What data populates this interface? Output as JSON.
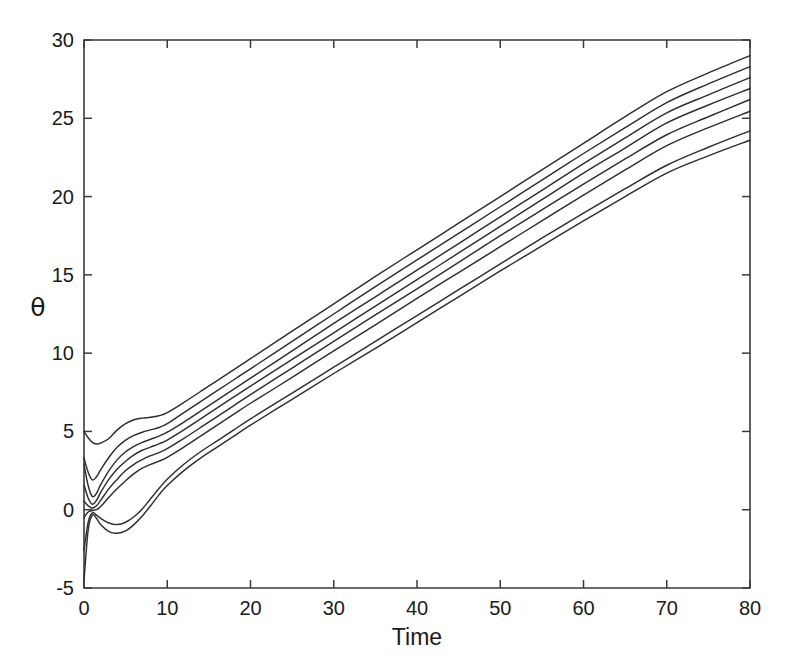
{
  "chart_data": {
    "type": "line",
    "title": "",
    "xlabel": "Time",
    "ylabel": "θ",
    "xlim": [
      0,
      80
    ],
    "ylim": [
      -5,
      30
    ],
    "xticks": [
      0,
      10,
      20,
      30,
      40,
      50,
      60,
      70,
      80
    ],
    "yticks": [
      -5,
      0,
      5,
      10,
      15,
      20,
      25,
      30
    ],
    "xtick_labels": [
      "0",
      "10",
      "20",
      "30",
      "40",
      "50",
      "60",
      "70",
      "80"
    ],
    "ytick_labels": [
      "-5",
      "0",
      "5",
      "10",
      "15",
      "20",
      "25",
      "30"
    ],
    "grid": false,
    "legend": false,
    "legend_position": "none",
    "series_count": 8,
    "line_color": "#2e2e2e",
    "background_color": "#ffffff",
    "axis_color": "#3b3b3b",
    "x": [
      0,
      0.5,
      1,
      1.5,
      2,
      3,
      4,
      5,
      6,
      7,
      8,
      9,
      10,
      12,
      14,
      16,
      18,
      20,
      25,
      30,
      35,
      40,
      45,
      50,
      55,
      60,
      65,
      70,
      75,
      80
    ],
    "series": [
      {
        "name": "curve-1",
        "values": [
          5.0,
          4.6,
          4.3,
          4.2,
          4.25,
          4.55,
          5.1,
          5.5,
          5.75,
          5.85,
          5.9,
          6.0,
          6.2,
          6.85,
          7.55,
          8.25,
          8.95,
          9.65,
          11.4,
          13.15,
          14.9,
          16.6,
          18.3,
          20.0,
          21.7,
          23.4,
          25.1,
          26.7,
          27.9,
          29.0
        ]
      },
      {
        "name": "curve-2",
        "values": [
          3.3,
          2.4,
          1.9,
          2.1,
          2.55,
          3.35,
          4.0,
          4.45,
          4.75,
          4.95,
          5.1,
          5.25,
          5.5,
          6.2,
          6.9,
          7.6,
          8.3,
          9.0,
          10.75,
          12.5,
          14.25,
          15.95,
          17.65,
          19.35,
          21.05,
          22.75,
          24.4,
          26.0,
          27.2,
          28.3
        ]
      },
      {
        "name": "curve-3",
        "values": [
          2.9,
          1.55,
          0.85,
          1.05,
          1.6,
          2.5,
          3.2,
          3.7,
          4.05,
          4.3,
          4.5,
          4.7,
          4.95,
          5.6,
          6.3,
          7.0,
          7.7,
          8.4,
          10.15,
          11.9,
          13.6,
          15.3,
          17.0,
          18.7,
          20.4,
          22.1,
          23.75,
          25.35,
          26.5,
          27.6
        ]
      },
      {
        "name": "curve-4",
        "values": [
          1.6,
          0.75,
          0.35,
          0.6,
          1.1,
          1.95,
          2.6,
          3.1,
          3.5,
          3.8,
          4.0,
          4.2,
          4.45,
          5.1,
          5.8,
          6.5,
          7.2,
          7.9,
          9.6,
          11.3,
          13.0,
          14.7,
          16.4,
          18.1,
          19.8,
          21.5,
          23.1,
          24.7,
          25.85,
          26.9
        ]
      },
      {
        "name": "curve-5",
        "values": [
          0.55,
          0.25,
          0.1,
          0.25,
          0.6,
          1.35,
          1.95,
          2.5,
          2.9,
          3.2,
          3.45,
          3.65,
          3.9,
          4.55,
          5.25,
          5.95,
          6.65,
          7.35,
          9.05,
          10.75,
          12.45,
          14.1,
          15.8,
          17.5,
          19.15,
          20.8,
          22.4,
          23.95,
          25.1,
          26.2
        ]
      },
      {
        "name": "curve-6",
        "values": [
          -0.5,
          -0.15,
          -0.05,
          0.0,
          0.2,
          0.8,
          1.35,
          1.85,
          2.3,
          2.65,
          2.9,
          3.1,
          3.35,
          4.0,
          4.7,
          5.4,
          6.1,
          6.8,
          8.45,
          10.15,
          11.8,
          13.5,
          15.15,
          16.8,
          18.45,
          20.1,
          21.7,
          23.25,
          24.4,
          25.45
        ]
      },
      {
        "name": "curve-7",
        "values": [
          -2.6,
          -0.8,
          -0.2,
          -0.35,
          -0.55,
          -0.85,
          -0.95,
          -0.8,
          -0.45,
          0.05,
          0.7,
          1.35,
          1.95,
          2.9,
          3.7,
          4.4,
          5.1,
          5.8,
          7.45,
          9.1,
          10.75,
          12.4,
          14.05,
          15.7,
          17.35,
          18.95,
          20.5,
          22.0,
          23.15,
          24.2
        ]
      },
      {
        "name": "curve-8",
        "values": [
          -4.5,
          -1.3,
          -0.35,
          -0.55,
          -0.95,
          -1.4,
          -1.5,
          -1.35,
          -0.95,
          -0.4,
          0.25,
          0.95,
          1.55,
          2.5,
          3.3,
          4.0,
          4.7,
          5.4,
          7.05,
          8.7,
          10.3,
          11.95,
          13.6,
          15.25,
          16.85,
          18.45,
          20.0,
          21.5,
          22.6,
          23.6
        ]
      }
    ]
  },
  "figure": {
    "caption": ""
  }
}
